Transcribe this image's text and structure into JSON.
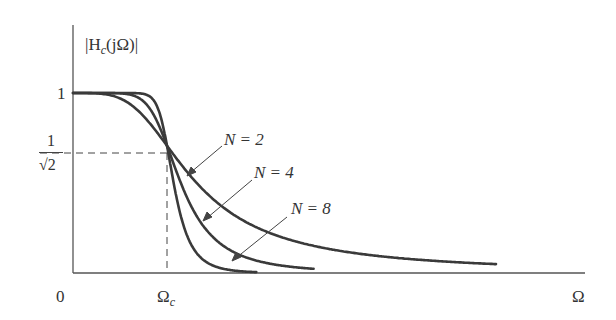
{
  "chart_data": {
    "type": "line",
    "title": "",
    "xlabel": "Ω",
    "ylabel": "|H_c(jΩ)|",
    "x_ticks": [
      "0",
      "Ω_c",
      "Ω"
    ],
    "y_ticks": [
      "1",
      "1/√2"
    ],
    "grid": false,
    "legend_position": "inline annotations with arrows",
    "annotations": [
      "N = 2",
      "N = 4",
      "N = 8"
    ],
    "reference_lines": [
      {
        "type": "horizontal-dashed",
        "y": 0.7071,
        "label": "1/√2",
        "x_range": [
          0,
          1
        ]
      },
      {
        "type": "vertical-dashed",
        "x": 1,
        "label": "Ω_c",
        "y_range": [
          0,
          0.7071
        ]
      }
    ],
    "x_range": [
      0,
      4.4
    ],
    "y_range": [
      0,
      1.0
    ],
    "series": [
      {
        "name": "N = 2",
        "formula": "1/sqrt(1+(Ω/Ωc)^(2N))",
        "x": [
          0,
          0.5,
          0.8,
          1.0,
          1.5,
          2.0,
          3.0,
          4.3
        ],
        "values": [
          1.0,
          0.97,
          0.84,
          0.707,
          0.41,
          0.24,
          0.11,
          0.05
        ]
      },
      {
        "name": "N = 4",
        "formula": "1/sqrt(1+(Ω/Ωc)^(2N))",
        "x": [
          0,
          0.5,
          0.8,
          1.0,
          1.5,
          2.0,
          2.5
        ],
        "values": [
          1.0,
          1.0,
          0.93,
          0.707,
          0.19,
          0.06,
          0.02
        ]
      },
      {
        "name": "N = 8",
        "formula": "1/sqrt(1+(Ω/Ωc)^(2N))",
        "x": [
          0,
          0.5,
          0.8,
          1.0,
          1.3,
          1.6,
          1.9
        ],
        "values": [
          1.0,
          1.0,
          0.99,
          0.707,
          0.1,
          0.02,
          0.004
        ]
      }
    ]
  },
  "labels": {
    "ylabel": "|H",
    "ylabel_sub": "c",
    "ylabel_rest": "(jΩ)|",
    "tick_one": "1",
    "tick_frac_num": "1",
    "tick_frac_den": "√2",
    "origin": "0",
    "omega_c": "Ω",
    "omega_c_sub": "c",
    "omega": "Ω",
    "n2": "N = 2",
    "n4": "N = 4",
    "n8": "N = 8"
  }
}
